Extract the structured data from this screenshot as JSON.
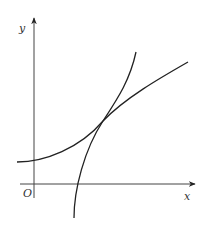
{
  "figure": {
    "type": "function-graph",
    "colors": {
      "stroke": "#222222",
      "axis": "#333333",
      "background": "#ffffff"
    },
    "axes": {
      "x_label": "x",
      "y_label": "y",
      "origin_label": "O"
    },
    "curves": [
      {
        "name": "exponential-curve",
        "description": "increasing convex curve crossing y-axis above origin"
      },
      {
        "name": "logarithmic-curve",
        "description": "steep increasing concave curve crossing x-axis right of origin"
      }
    ],
    "tangent_point": "the two curves touch at a single point"
  }
}
